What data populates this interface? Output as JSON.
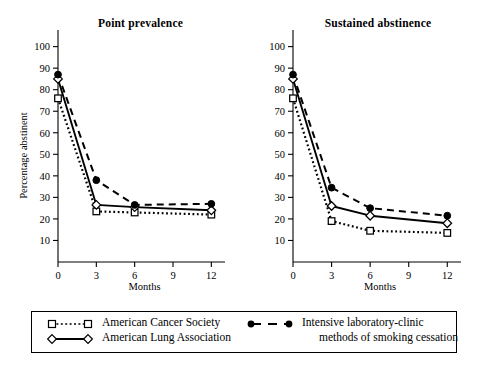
{
  "chart_data": [
    {
      "type": "line",
      "title": "Point prevalence",
      "xlabel": "Months",
      "ylabel": "Percentage abstinent",
      "x": [
        0,
        3,
        6,
        12
      ],
      "xlim": [
        0,
        12.6
      ],
      "ylim": [
        0,
        104
      ],
      "xticks": [
        0,
        3,
        6,
        9,
        12
      ],
      "yticks": [
        10,
        20,
        30,
        40,
        50,
        60,
        70,
        80,
        90,
        100
      ],
      "grid": false,
      "legend_position": "below-figure",
      "series": [
        {
          "name": "American Cancer Society",
          "values": [
            76,
            23.5,
            23,
            22
          ],
          "marker": "open-square",
          "line": "dotted"
        },
        {
          "name": "American Lung Association",
          "values": [
            85,
            26.5,
            25.5,
            24
          ],
          "marker": "open-diamond",
          "line": "solid"
        },
        {
          "name": "Intensive laboratory-clinic methods of smoking cessation",
          "values": [
            87,
            38,
            26.5,
            27
          ],
          "marker": "filled-circle",
          "line": "dashed"
        }
      ]
    },
    {
      "type": "line",
      "title": "Sustained abstinence",
      "xlabel": "Months",
      "ylabel": "Percentage abstinent",
      "x": [
        0,
        3,
        6,
        12
      ],
      "xlim": [
        0,
        12.6
      ],
      "ylim": [
        0,
        104
      ],
      "xticks": [
        0,
        3,
        6,
        9,
        12
      ],
      "yticks": [
        10,
        20,
        30,
        40,
        50,
        60,
        70,
        80,
        90,
        100
      ],
      "grid": false,
      "legend_position": "below-figure",
      "series": [
        {
          "name": "American Cancer Society",
          "values": [
            76,
            19,
            14.5,
            13.5
          ],
          "marker": "open-square",
          "line": "dotted"
        },
        {
          "name": "American Lung Association",
          "values": [
            85,
            26,
            21.5,
            18
          ],
          "marker": "open-diamond",
          "line": "solid"
        },
        {
          "name": "Intensive laboratory-clinic methods of smoking cessation",
          "values": [
            87,
            34.5,
            25,
            21.5
          ],
          "marker": "filled-circle",
          "line": "dashed"
        }
      ]
    }
  ],
  "panels": {
    "left": {
      "title": "Point prevalence",
      "xlabel": "Months",
      "ylabel": "Percentage abstinent"
    },
    "right": {
      "title": "Sustained abstinence",
      "xlabel": "Months",
      "ylabel": "Percentage abstinent"
    }
  },
  "legend": {
    "entries": [
      {
        "label": "American Cancer Society",
        "marker": "open-square",
        "line": "dotted"
      },
      {
        "label": "American Lung Association",
        "marker": "open-diamond",
        "line": "solid"
      },
      {
        "label": "Intensive laboratory-clinic",
        "marker": "filled-circle",
        "line": "dashed"
      },
      {
        "label": "methods of smoking cessation",
        "marker": "none",
        "line": "none"
      }
    ]
  },
  "colors": {
    "foreground": "#000000",
    "background": "#ffffff"
  }
}
